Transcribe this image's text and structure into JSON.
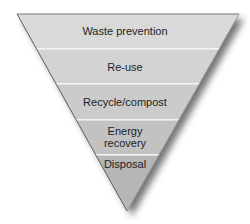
{
  "diagram": {
    "type": "inverted-pyramid",
    "levels": [
      {
        "label": "Waste prevention",
        "color": "#d9d9d9"
      },
      {
        "label": "Re-use",
        "color": "#d3d3d3"
      },
      {
        "label": "Recycle/compost",
        "color": "#cbcbcb"
      },
      {
        "label": "Energy\nrecovery",
        "line1": "Energy",
        "line2": "recovery",
        "color": "#c2c2c2"
      },
      {
        "label": "Disposal",
        "color": "#b6b6b6"
      }
    ],
    "divider_color": "#f4f4f4",
    "outline_color": "#6a6a6a"
  }
}
